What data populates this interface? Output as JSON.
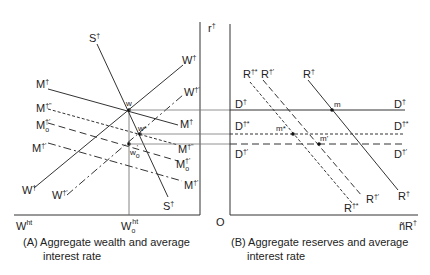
{
  "panel_a": {
    "caption_line1": "(A) Aggregate wealth and average",
    "caption_line2": "interest rate",
    "x_axis_label_left": "W",
    "x_axis_label_left_sup": "ht",
    "x_axis_label_mid": "W",
    "x_axis_label_mid_sub": "o",
    "x_axis_label_mid_sup": "ht",
    "curves": {
      "S": {
        "label": "S",
        "sup": "†"
      },
      "W": {
        "label": "W",
        "sup": "†"
      },
      "W_prime": {
        "label": "W",
        "sup": "†'"
      },
      "M": {
        "label": "M",
        "sup": "†"
      },
      "M_dprime": {
        "label": "M",
        "sup": "†\""
      },
      "M_o_prime": {
        "label": "M",
        "sub": "o",
        "sup": "†'"
      },
      "M_prime": {
        "label": "M",
        "sup": "†'"
      }
    },
    "points": {
      "w": "w",
      "w_star": "w*",
      "w_o_prime": "w",
      "w_o_prime_sub": "o",
      "w_o_prime_sup": "'"
    }
  },
  "panel_b": {
    "caption_line1": "(B) Aggregate reserves and average",
    "caption_line2": "interest rate",
    "y_axis_label": "r",
    "y_axis_sup": "†",
    "origin_label": "O",
    "x_axis_label": "ñR",
    "x_axis_sup": "†",
    "curves": {
      "D": {
        "label": "D",
        "sup": "†"
      },
      "D_star": {
        "label": "D",
        "sup": "†*"
      },
      "D_prime": {
        "label": "D",
        "sup": "†'"
      },
      "R": {
        "label": "R",
        "sup": "†"
      },
      "R_prime": {
        "label": "R",
        "sup": "†'"
      },
      "R_star": {
        "label": "R",
        "sup": "†*"
      }
    },
    "points": {
      "m": "m",
      "m_star": "m*",
      "m_prime": "m'"
    }
  }
}
